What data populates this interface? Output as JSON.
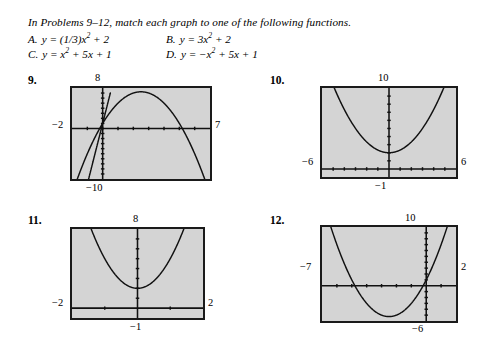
{
  "instructions": "In Problems 9–12, match each graph to one of the following functions.",
  "choices": [
    {
      "letter": "A.",
      "expr_html": "y = (1/3)x<sup>2</sup> + 2"
    },
    {
      "letter": "B.",
      "expr_html": "y = 3x<sup>2</sup> + 2"
    },
    {
      "letter": "C.",
      "expr_html": "y = x<sup>2</sup> + 5x + 1"
    },
    {
      "letter": "D.",
      "expr_html": "y = −x<sup>2</sup> + 5x + 1"
    }
  ],
  "colors": {
    "screen_fill": "#d4d4d4",
    "screen_border": "#1a1a1a",
    "curve": "#111111",
    "axis": "#111111",
    "page_background": "#ffffff",
    "text": "#000000"
  },
  "problems": [
    {
      "number": "9.",
      "labels": {
        "top": "8",
        "left": "−2",
        "right": "7",
        "bottom": "−10"
      },
      "chart_data": {
        "type": "line",
        "title": "9.",
        "xlabel": "",
        "ylabel": "",
        "xlim": [
          -2,
          7
        ],
        "ylim": [
          -10,
          8
        ],
        "grid": false,
        "legend": "none",
        "xticks": [
          -1,
          0,
          1,
          2,
          3,
          4,
          5,
          6
        ],
        "yticks": [
          -9,
          -8,
          -7,
          -6,
          -5,
          -4,
          -3,
          -2,
          -1,
          1,
          2,
          3,
          4,
          5,
          6,
          7
        ],
        "series": [
          {
            "name": "y = -x^2 + 5x + 1",
            "formula": "-x*x + 5*x + 1",
            "x": [
              -2,
              -1.5,
              -1,
              -0.5,
              0,
              0.5,
              1,
              1.5,
              2,
              2.5,
              3,
              3.5,
              4,
              4.5,
              5,
              5.5,
              6,
              6.5,
              7
            ],
            "values": [
              -13,
              -8.75,
              -5,
              -1.75,
              1,
              3.25,
              5,
              6.25,
              7,
              7.25,
              7,
              6.25,
              5,
              3.25,
              1,
              -1.75,
              -5,
              -8.75,
              -13
            ]
          },
          {
            "name": "steep rising branch",
            "formula": "12*x + 1",
            "x": [
              -1,
              -0.5,
              0,
              0.5
            ],
            "values": [
              -11,
              -5,
              1,
              7
            ]
          }
        ],
        "annotations": [
          "vertex near (2.5, 7.25)",
          "x-axis crossings near x = -0.2 and x = 5.2"
        ]
      }
    },
    {
      "number": "10.",
      "labels": {
        "top": "10",
        "left": "−6",
        "right": "6",
        "bottom": "−1"
      },
      "chart_data": {
        "type": "line",
        "title": "10.",
        "xlabel": "",
        "ylabel": "",
        "xlim": [
          -6,
          6
        ],
        "ylim": [
          -1,
          10
        ],
        "grid": false,
        "legend": "none",
        "xticks": [
          -5,
          -4,
          -3,
          -2,
          -1,
          1,
          2,
          3,
          4,
          5
        ],
        "yticks": [
          1,
          2,
          3,
          4,
          5,
          6,
          7,
          8,
          9
        ],
        "series": [
          {
            "name": "y = (1/3)x^2 + 2",
            "formula": "x*x/3 + 2",
            "x": [
              -6,
              -5,
              -4,
              -3,
              -2,
              -1,
              0,
              1,
              2,
              3,
              4,
              5,
              6
            ],
            "values": [
              14,
              10.33,
              7.33,
              5,
              3.33,
              2.33,
              2,
              2.33,
              3.33,
              5,
              7.33,
              10.33,
              14
            ]
          }
        ],
        "annotations": [
          "vertex at (0, 2)",
          "wide opening upward parabola"
        ]
      }
    },
    {
      "number": "11.",
      "labels": {
        "top": "8",
        "left": "−2",
        "right": "2",
        "bottom": "−1"
      },
      "chart_data": {
        "type": "line",
        "title": "11.",
        "xlabel": "",
        "ylabel": "",
        "xlim": [
          -2,
          2
        ],
        "ylim": [
          -1,
          8
        ],
        "grid": false,
        "legend": "none",
        "xticks": [
          -1,
          1
        ],
        "yticks": [
          1,
          2,
          3,
          4,
          5,
          6,
          7
        ],
        "series": [
          {
            "name": "y = 3x^2 + 2",
            "formula": "3*x*x + 2",
            "x": [
              -2,
              -1.5,
              -1.25,
              -1,
              -0.75,
              -0.5,
              -0.25,
              0,
              0.25,
              0.5,
              0.75,
              1,
              1.25,
              1.5,
              2
            ],
            "values": [
              14,
              8.75,
              6.69,
              5,
              3.69,
              2.75,
              2.19,
              2,
              2.19,
              2.75,
              3.69,
              5,
              6.69,
              8.75,
              14
            ]
          }
        ],
        "annotations": [
          "vertex at (0, 2)",
          "narrow opening upward parabola"
        ]
      }
    },
    {
      "number": "12.",
      "labels": {
        "top": "10",
        "left": "−7",
        "right": "2",
        "bottom": "−6"
      },
      "chart_data": {
        "type": "line",
        "title": "12.",
        "xlabel": "",
        "ylabel": "",
        "xlim": [
          -7,
          2
        ],
        "ylim": [
          -6,
          10
        ],
        "grid": false,
        "legend": "none",
        "xticks": [
          -6,
          -5,
          -4,
          -3,
          -2,
          -1,
          1
        ],
        "yticks": [
          -5,
          -4,
          -3,
          -2,
          -1,
          1,
          2,
          3,
          4,
          5,
          6,
          7,
          8,
          9
        ],
        "series": [
          {
            "name": "y = x^2 + 5x + 1",
            "formula": "x*x + 5*x + 1",
            "x": [
              -7,
              -6.5,
              -6,
              -5.5,
              -5,
              -4.5,
              -4,
              -3.5,
              -3,
              -2.5,
              -2,
              -1.5,
              -1,
              -0.5,
              0,
              0.5,
              1,
              1.5,
              2
            ],
            "values": [
              15,
              10.75,
              7,
              3.75,
              1,
              -1.25,
              -3,
              -4.25,
              -5,
              -5.25,
              -5,
              -4.25,
              -3,
              -1.25,
              1,
              3.75,
              7,
              10.75,
              15
            ]
          }
        ],
        "annotations": [
          "vertex at (-2.5, -5.25)",
          "roots near x = -4.79 and x = -0.21"
        ]
      }
    }
  ]
}
